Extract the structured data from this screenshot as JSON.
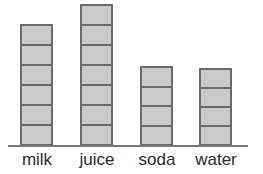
{
  "chart_data": {
    "type": "bar",
    "title": "",
    "subtitle": "",
    "xlabel": "",
    "ylabel": "",
    "categories": [
      "milk",
      "juice",
      "soda",
      "water"
    ],
    "values": [
      6,
      7,
      4,
      4
    ],
    "unit_label": "segments",
    "ylim": [
      0,
      7
    ],
    "grid": false,
    "legend": null,
    "annotations": []
  },
  "style": {
    "bar_fill": "#c9c9c9",
    "bar_outline": "#6b6b6b",
    "axis_color": "#777777",
    "label_color": "#2b2b2b",
    "background": "#ffffff"
  },
  "axis": {
    "baseline_name": "x-axis"
  },
  "bars": [
    {
      "label": "milk",
      "segments": 6,
      "left": 20,
      "width": 33,
      "top": 24,
      "height": 122
    },
    {
      "label": "juice",
      "segments": 7,
      "left": 80,
      "width": 33,
      "top": 4,
      "height": 142
    },
    {
      "label": "soda",
      "segments": 4,
      "left": 140,
      "width": 33,
      "top": 66,
      "height": 80
    },
    {
      "label": "water",
      "segments": 4,
      "left": 199,
      "width": 33,
      "top": 68,
      "height": 78
    }
  ],
  "labels": [
    {
      "text": "milk",
      "left": 11,
      "width": 52
    },
    {
      "text": "juice",
      "left": 69,
      "width": 56
    },
    {
      "text": "soda",
      "left": 130,
      "width": 54
    },
    {
      "text": "water",
      "left": 187,
      "width": 58
    }
  ]
}
